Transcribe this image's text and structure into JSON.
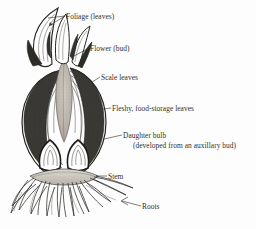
{
  "figure": {
    "subject": "bulb",
    "style": "pen-and-ink line drawing with stipple shading",
    "background_color": "#fdfdfd",
    "ink_color": "#2b2a28",
    "text_color": "#312f2d"
  },
  "labels": {
    "foliage": "Foliage (leaves)",
    "flower": "Flower (bud)",
    "scale_leaves": "Scale leaves",
    "fleshy": "Fleshy, food-storage leaves",
    "daughter_bulb_line1": "Daughter bulb",
    "daughter_bulb_line2": "(developed from an auxillary bud)",
    "stem": "Stem",
    "roots": "Roots"
  }
}
